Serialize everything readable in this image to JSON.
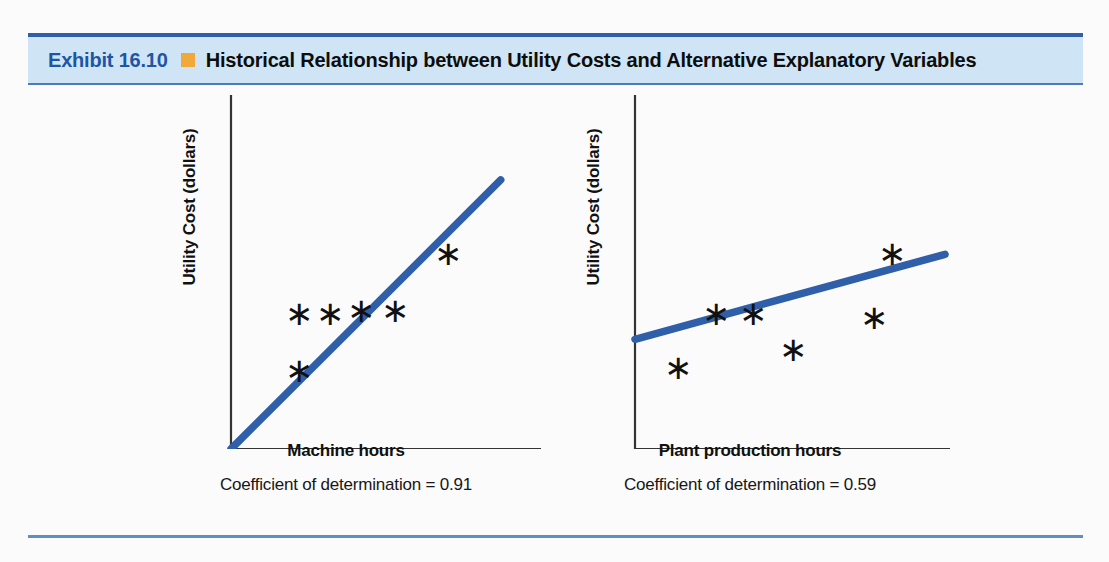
{
  "exhibit": {
    "label": "Exhibit 16.10",
    "bullet_icon": "orange-square-bullet",
    "title": "Historical Relationship between Utility Costs and Alternative Explanatory Variables",
    "label_color": "#1f55a5",
    "band_color": "#cfe5f5",
    "bullet_color": "#f2a93b",
    "rule_color": "#2f5fa8"
  },
  "chart_data": [
    {
      "id": "machine-hours",
      "type": "scatter",
      "title": "",
      "xlabel": "Machine hours",
      "ylabel": "Utility Cost (dollars)",
      "caption": "Coefficient of determination = 0.91",
      "coefficient_of_determination": 0.91,
      "grid": false,
      "legend": "none",
      "axis_color": "#333333",
      "line_color": "#2f5fa8",
      "xlim": [
        0,
        100
      ],
      "ylim": [
        0,
        100
      ],
      "points": [
        {
          "x": 22,
          "y": 22
        },
        {
          "x": 22,
          "y": 38
        },
        {
          "x": 32,
          "y": 38
        },
        {
          "x": 42,
          "y": 39
        },
        {
          "x": 53,
          "y": 39
        },
        {
          "x": 70,
          "y": 55
        }
      ],
      "trendline": {
        "x0": 0,
        "y0": 0,
        "x1": 87,
        "y1": 76
      }
    },
    {
      "id": "plant-production-hours",
      "type": "scatter",
      "title": "",
      "xlabel": "Plant production hours",
      "ylabel": "Utility Cost (dollars)",
      "caption": "Coefficient of determination = 0.59",
      "coefficient_of_determination": 0.59,
      "grid": false,
      "legend": "none",
      "axis_color": "#333333",
      "line_color": "#2f5fa8",
      "xlim": [
        0,
        100
      ],
      "ylim": [
        0,
        100
      ],
      "points": [
        {
          "x": 14,
          "y": 23
        },
        {
          "x": 26,
          "y": 38
        },
        {
          "x": 38,
          "y": 38
        },
        {
          "x": 51,
          "y": 28
        },
        {
          "x": 77,
          "y": 37
        },
        {
          "x": 83,
          "y": 55
        }
      ],
      "trendline": {
        "x0": 0,
        "y0": 31,
        "x1": 100,
        "y1": 55
      }
    }
  ]
}
